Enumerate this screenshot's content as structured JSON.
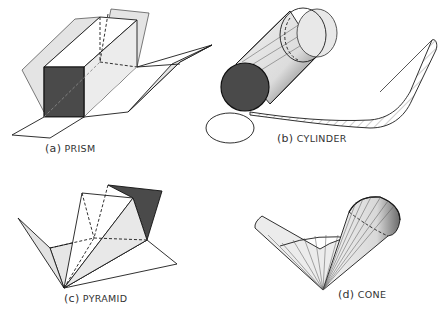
{
  "figure": {
    "colors": {
      "stroke": "#1a1a1a",
      "dark_fill": "#4a4a4a",
      "light_fill": "#e6e6e6",
      "mid_fill": "#cfcfcf",
      "background": "#ffffff"
    },
    "panels": [
      {
        "id": "a",
        "letter": "(a)",
        "name": "PRISM"
      },
      {
        "id": "b",
        "letter": "(b)",
        "name": "CYLINDER"
      },
      {
        "id": "c",
        "letter": "(c)",
        "name": "PYRAMID"
      },
      {
        "id": "d",
        "letter": "(d)",
        "name": "CONE"
      }
    ]
  }
}
